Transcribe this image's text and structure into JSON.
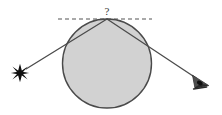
{
  "figure": {
    "canvas": {
      "width": 222,
      "height": 115,
      "background": "#ffffff"
    },
    "colors": {
      "background": "#ffffff",
      "sphere_fill": "#d2d2d2",
      "sphere_stroke": "#4a4a4a",
      "ray_stroke": "#4b4b4b",
      "dashed_stroke": "#555555",
      "star_fill": "#111111",
      "eye_fill": "#222222",
      "label_fill": "#3a3a3a"
    },
    "elements": {
      "sphere": {
        "name": "massive-body",
        "center_x": 107,
        "center_y": 63.5,
        "radius": 44.5,
        "stroke_width": 1.4
      },
      "apex_point": {
        "x": 107,
        "y": 19
      },
      "tangent_line": {
        "label": "?",
        "label_x": 107,
        "label_y": 12,
        "x1": 58,
        "y1": 19,
        "x2": 152,
        "y2": 19,
        "dash_pattern": "4 3",
        "stroke_width": 1.2
      },
      "incoming_ray": {
        "from_x": 26,
        "from_y": 69,
        "to_x": 107,
        "to_y": 19,
        "stroke_width": 1.3
      },
      "outgoing_ray": {
        "from_x": 107,
        "from_y": 19,
        "to_x": 196,
        "to_y": 78,
        "stroke_width": 1.3
      },
      "star": {
        "center_x": 20,
        "center_y": 73,
        "outer_radius": 9,
        "inner_radius": 2.1,
        "points": 6,
        "glyph_name": "star-icon"
      },
      "observer_eye": {
        "center_x": 201,
        "center_y": 82,
        "width": 17,
        "height": 15,
        "glyph_name": "eye-icon"
      }
    }
  }
}
